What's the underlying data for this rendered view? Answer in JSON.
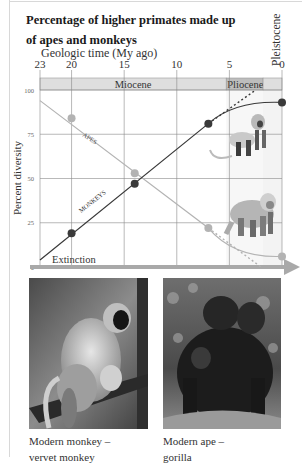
{
  "figure": {
    "title_line1": "Percentage of higher primates made up",
    "title_line2": "of apes and monkeys",
    "x_axis_title": "Geologic time (My ago)",
    "y_axis_title": "Percent diversity",
    "epoch_pleistocene": "Pleistocene"
  },
  "captions": {
    "monkey_line1": "Modern monkey –",
    "monkey_line2": "vervet monkey",
    "ape_line1": "Modern ape –",
    "ape_line2": "gorilla"
  },
  "chart_data": {
    "type": "line",
    "title": "Percentage of higher primates made up of apes and monkeys",
    "xlabel": "Geologic time (My ago)",
    "ylabel": "Percent diversity",
    "x_ticks": [
      "23",
      "20",
      "15",
      "10",
      "5",
      "0"
    ],
    "y_ticks": [
      "100",
      "75",
      "50",
      "25",
      "0"
    ],
    "xlim": [
      23,
      0
    ],
    "ylim": [
      0,
      100
    ],
    "grid": true,
    "epochs": [
      {
        "name": "Miocene",
        "start": 23,
        "end": 5.3
      },
      {
        "name": "Pliocene",
        "start": 5.3,
        "end": 1.8
      },
      {
        "name": "Pleistocene",
        "start": 1.8,
        "end": 0
      }
    ],
    "series": [
      {
        "name": "APES",
        "color": "#b3b3b3",
        "points": [
          [
            20,
            84
          ],
          [
            14,
            53
          ],
          [
            7,
            22
          ],
          [
            0,
            6
          ]
        ],
        "trend_start": [
          23,
          94
        ],
        "projection_dashed": [
          [
            7,
            22
          ],
          [
            2,
            0
          ]
        ]
      },
      {
        "name": "MONKEYS",
        "color": "#3a3a3a",
        "points": [
          [
            20,
            19
          ],
          [
            14,
            47
          ],
          [
            7,
            81
          ],
          [
            0,
            93
          ]
        ],
        "trend_start": [
          23,
          4
        ],
        "projection_dashed": [
          [
            7,
            81
          ],
          [
            2.5,
            100
          ]
        ]
      }
    ],
    "annotations": [
      "Extinction",
      "APES",
      "MONKEYS"
    ]
  }
}
